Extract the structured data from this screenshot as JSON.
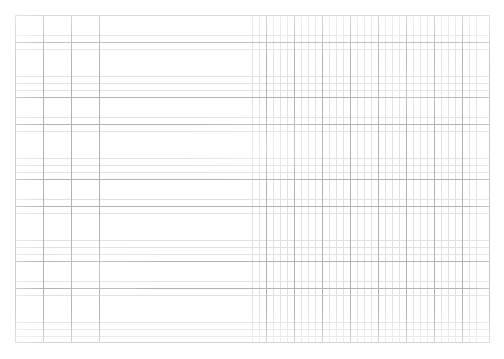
{
  "document": {
    "type": "grid-paper-sheet",
    "background_color": "#ffffff",
    "header_text": "",
    "caption": ""
  },
  "grid": {
    "left_px": 15,
    "top_px": 15,
    "width_px": 475,
    "height_px": 328,
    "major_columns": 17,
    "major_rows": 12,
    "major_cell_width_px": 27.94,
    "major_cell_height_px": 27.33,
    "minor_per_major": 4,
    "major_line_color": "#b2b2b2",
    "minor_line_color": "#d8d8d8",
    "major_line_width_px": 0.7,
    "minor_line_width_px": 0.5
  },
  "chart_data": {
    "type": "table",
    "title": "",
    "subtitle": "",
    "xlabel": "",
    "ylabel": "",
    "categories": [],
    "values": [],
    "series": [],
    "annotations": [],
    "legend": [],
    "grid": true,
    "legend_position": "none",
    "note": "Blank grid/graph paper — no plotted data, no tick labels, no legend."
  }
}
